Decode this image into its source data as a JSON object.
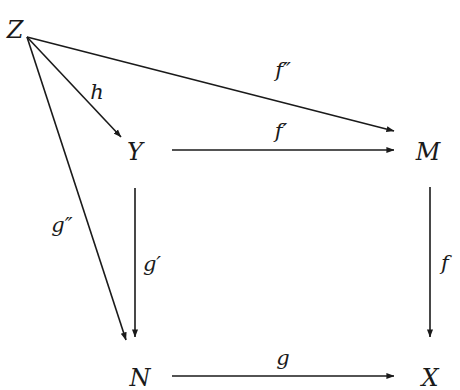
{
  "diagram": {
    "type": "commutative-diagram",
    "stroke_color": "#1a1a1a",
    "background": "#ffffff",
    "nodes": [
      {
        "id": "Z",
        "label": "Z",
        "x": 15,
        "y": 30
      },
      {
        "id": "Y",
        "label": "Y",
        "x": 135,
        "y": 152
      },
      {
        "id": "M",
        "label": "M",
        "x": 428,
        "y": 152
      },
      {
        "id": "N",
        "label": "N",
        "x": 140,
        "y": 378
      },
      {
        "id": "X",
        "label": "X",
        "x": 430,
        "y": 378
      }
    ],
    "edges": [
      {
        "id": "h",
        "from": "Z",
        "to": "Y",
        "label": "h",
        "x1": 27,
        "y1": 37,
        "x2": 121,
        "y2": 137,
        "lx": 97,
        "ly": 92
      },
      {
        "id": "f2",
        "from": "Z",
        "to": "M",
        "label": "f″",
        "x1": 27,
        "y1": 37,
        "x2": 394,
        "y2": 131,
        "lx": 283,
        "ly": 70
      },
      {
        "id": "f1",
        "from": "Y",
        "to": "M",
        "label": "f′",
        "x1": 172,
        "y1": 150,
        "x2": 394,
        "y2": 150,
        "lx": 281,
        "ly": 131
      },
      {
        "id": "g2",
        "from": "Z",
        "to": "N",
        "label": "g″",
        "x1": 27,
        "y1": 37,
        "x2": 126,
        "y2": 340,
        "lx": 62,
        "ly": 225
      },
      {
        "id": "g1",
        "from": "Y",
        "to": "N",
        "label": "g′",
        "x1": 135,
        "y1": 188,
        "x2": 135,
        "y2": 337,
        "lx": 152,
        "ly": 264
      },
      {
        "id": "f",
        "from": "M",
        "to": "X",
        "label": "f",
        "x1": 430,
        "y1": 187,
        "x2": 430,
        "y2": 337,
        "lx": 445,
        "ly": 263
      },
      {
        "id": "g",
        "from": "N",
        "to": "X",
        "label": "g",
        "x1": 172,
        "y1": 376,
        "x2": 394,
        "y2": 376,
        "lx": 283,
        "ly": 358
      }
    ]
  }
}
